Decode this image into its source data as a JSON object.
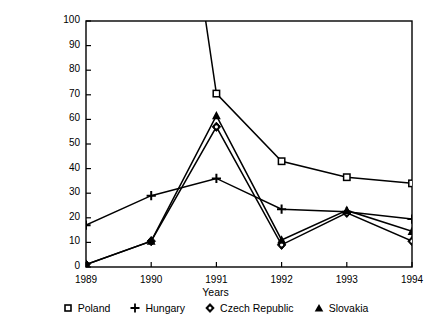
{
  "chart_data": {
    "type": "line",
    "title": "",
    "xlabel": "Years",
    "ylabel": "Annual rate of change in per cent",
    "categories": [
      "1989",
      "1990",
      "1991",
      "1992",
      "1993",
      "1994"
    ],
    "x": [
      1989,
      1990,
      1991,
      1992,
      1993,
      1994
    ],
    "xlim": [
      1989,
      1994
    ],
    "ylim": [
      0,
      100
    ],
    "yticks": [
      0,
      10,
      20,
      30,
      40,
      50,
      60,
      70,
      80,
      90,
      100
    ],
    "xticks": [
      "1989",
      "1990",
      "1991",
      "1992",
      "1993",
      "1994"
    ],
    "grid": false,
    "legend_position": "bottom",
    "series": [
      {
        "name": "Poland",
        "marker": "square",
        "values": [
          null,
          250,
          70.5,
          43,
          36.5,
          34
        ],
        "note": "1990 value exceeds the 100 axis maximum and is clipped at the top border"
      },
      {
        "name": "Hungary",
        "marker": "plus",
        "values": [
          17,
          29,
          36,
          23.5,
          22.5,
          19.5
        ]
      },
      {
        "name": "Czech Republic",
        "marker": "diamond",
        "values": [
          1,
          10.5,
          57,
          9,
          22,
          10.5
        ]
      },
      {
        "name": "Slovakia",
        "marker": "triangle",
        "values": [
          1,
          10.5,
          61.5,
          11,
          23,
          14.5
        ]
      }
    ]
  },
  "legend": {
    "items": [
      {
        "label": "Poland",
        "marker": "square"
      },
      {
        "label": "Hungary",
        "marker": "plus"
      },
      {
        "label": "Czech Republic",
        "marker": "diamond"
      },
      {
        "label": "Slovakia",
        "marker": "triangle"
      }
    ]
  },
  "axes": {
    "y_title": "Annual rate of change in per cent",
    "x_title": "Years",
    "y_tick_labels": [
      "100",
      "90",
      "80",
      "70",
      "60",
      "50",
      "40",
      "30",
      "20",
      "10",
      "0"
    ],
    "x_tick_labels": [
      "1989",
      "1990",
      "1991",
      "1992",
      "1993",
      "1994"
    ]
  },
  "colors": {
    "line": "#000000",
    "background": "#ffffff",
    "axis": "#000000"
  }
}
